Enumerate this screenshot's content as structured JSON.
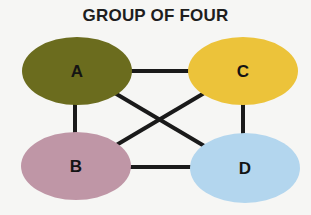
{
  "title": "GROUP OF FOUR",
  "nodes": [
    {
      "id": "A",
      "label": "A",
      "color": "#6b6c1e"
    },
    {
      "id": "B",
      "label": "B",
      "color": "#bf96a6"
    },
    {
      "id": "C",
      "label": "C",
      "color": "#ecc33a"
    },
    {
      "id": "D",
      "label": "D",
      "color": "#b3d6ee"
    }
  ],
  "edges": [
    {
      "from": "A",
      "to": "C"
    },
    {
      "from": "A",
      "to": "B"
    },
    {
      "from": "C",
      "to": "D"
    },
    {
      "from": "B",
      "to": "D"
    },
    {
      "from": "A",
      "to": "D"
    },
    {
      "from": "C",
      "to": "B"
    }
  ],
  "colors": {
    "edge": "#1a1a1a",
    "background": "#f6f6f4"
  }
}
